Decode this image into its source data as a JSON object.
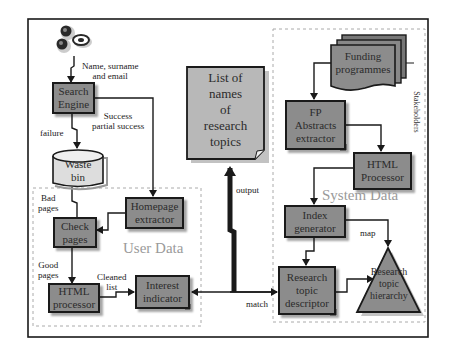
{
  "diagram": {
    "regions": {
      "user_data": {
        "title": "User Data"
      },
      "system_data": {
        "title": "System Data",
        "side_label": "Stakeholder's (rotated)"
      }
    },
    "nodes": {
      "users": {
        "label": "users-icon"
      },
      "search_engine": {
        "line1": "Search",
        "line2": "Engine"
      },
      "waste_bin": {
        "line1": "Waste",
        "line2": "bin"
      },
      "check_pages": {
        "line1": "Check",
        "line2": "pages"
      },
      "homepage_extractor": {
        "line1": "Homepage",
        "line2": "extractor"
      },
      "html_processor_user": {
        "line1": "HTML",
        "line2": "processor"
      },
      "interest_indicator": {
        "line1": "Interest",
        "line2": "indicator"
      },
      "list_of_topics": {
        "line1": "List of",
        "line2": "names",
        "line3": "of",
        "line4": "research",
        "line5": "topics"
      },
      "funding_programmes": {
        "line1": "Funding",
        "line2": "programmes"
      },
      "fp_abstracts_extractor": {
        "line1": "FP",
        "line2": "Abstracts",
        "line3": "extractor"
      },
      "html_processor_system": {
        "line1": "HTML",
        "line2": "Processor"
      },
      "index_generator": {
        "line1": "Index",
        "line2": "generator"
      },
      "research_topic_descriptor": {
        "line1": "Research",
        "line2": "topic",
        "line3": "descriptor"
      },
      "research_topic_hierarchy": {
        "line1": "Research",
        "line2": "topic",
        "line3": "hierarchy"
      }
    },
    "edge_labels": {
      "input": {
        "line1": "Name, surname",
        "line2": "and email"
      },
      "success": {
        "line1": "Success",
        "line2": "partial success"
      },
      "failure": "failure",
      "bad_pages": {
        "line1": "Bad",
        "line2": "pages"
      },
      "good_pages": {
        "line1": "Good",
        "line2": "pages"
      },
      "cleaned_list": {
        "line1": "Cleaned",
        "line2": "list"
      },
      "output": "output",
      "match": "match",
      "map": "map"
    },
    "colors": {
      "box_fill": "#8c8c8c",
      "doc_fill": "#b8b8b8",
      "stroke": "#1a1a1a",
      "region_title": "#9a9a9a"
    }
  }
}
